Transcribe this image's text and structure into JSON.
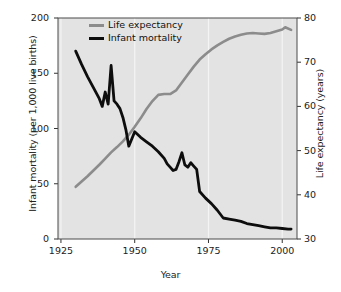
{
  "chart_data": {
    "type": "line",
    "title": "",
    "xlabel": "Year",
    "ylabel_left": "Infant mortality (per 1,000 live births)",
    "ylabel_right": "Life expectancy (years)",
    "xlim": [
      1924,
      2005
    ],
    "ylim_left": [
      0,
      200
    ],
    "ylim_right": [
      30,
      80
    ],
    "xticks": [
      1925,
      1950,
      1975,
      2000
    ],
    "xticklabels": [
      "1925",
      "1950",
      "1975",
      "2000"
    ],
    "yticks_left": [
      0,
      50,
      100,
      150,
      200
    ],
    "yticklabels_left": [
      "0",
      "50",
      "100",
      "150",
      "200"
    ],
    "yticks_right": [
      30,
      40,
      50,
      60,
      70,
      80
    ],
    "yticklabels_right": [
      "30",
      "40",
      "50",
      "60",
      "70",
      "80"
    ],
    "grid": "vertical-white-gridlines",
    "legend_position": "top-left-inside",
    "plot_background": "#e3e3e3",
    "series": [
      {
        "name": "Life expectancy",
        "axis": "right",
        "color": "#8c8c8c",
        "linewidth": 2.6,
        "x": [
          1930,
          1932,
          1934,
          1936,
          1938,
          1940,
          1942,
          1944,
          1946,
          1948,
          1950,
          1952,
          1954,
          1956,
          1958,
          1960,
          1962,
          1964,
          1966,
          1968,
          1970,
          1972,
          1974,
          1976,
          1978,
          1980,
          1982,
          1984,
          1986,
          1988,
          1990,
          1992,
          1994,
          1996,
          1998,
          2000,
          2001,
          2003
        ],
        "y": [
          41.8,
          43.0,
          44.2,
          45.5,
          46.8,
          48.2,
          49.6,
          50.8,
          52.1,
          53.6,
          55.4,
          57.3,
          59.4,
          61.2,
          62.6,
          62.8,
          62.8,
          63.6,
          65.4,
          67.2,
          69.0,
          70.6,
          71.8,
          72.9,
          73.8,
          74.6,
          75.3,
          75.8,
          76.2,
          76.5,
          76.6,
          76.5,
          76.4,
          76.6,
          77.0,
          77.4,
          77.9,
          77.3
        ]
      },
      {
        "name": "Infant mortality",
        "axis": "left",
        "color": "#0d0d0d",
        "linewidth": 2.8,
        "x": [
          1930,
          1932,
          1934,
          1936,
          1938,
          1939,
          1940,
          1941,
          1942,
          1943,
          1944,
          1945,
          1946,
          1947,
          1948,
          1950,
          1952,
          1954,
          1956,
          1958,
          1960,
          1961,
          1962,
          1963,
          1964,
          1965,
          1966,
          1967,
          1968,
          1969,
          1970,
          1971,
          1972,
          1974,
          1976,
          1978,
          1980,
          1982,
          1984,
          1986,
          1988,
          1990,
          1992,
          1994,
          1996,
          1998,
          2000,
          2002,
          2003
        ],
        "y": [
          170,
          158,
          147,
          137,
          127,
          120,
          133,
          122,
          157,
          125,
          122,
          118,
          110,
          99,
          84,
          97,
          92,
          88,
          84,
          79,
          73,
          68,
          65,
          62,
          63,
          70,
          78,
          67,
          65,
          69,
          66,
          63,
          43,
          37,
          32,
          26,
          19,
          18,
          17,
          16,
          14,
          13,
          12,
          11,
          10,
          10,
          9.5,
          9,
          9
        ]
      }
    ]
  },
  "legend": {
    "items": [
      {
        "label": "Life expectancy",
        "color": "#8c8c8c"
      },
      {
        "label": "Infant mortality",
        "color": "#0d0d0d"
      }
    ]
  },
  "axes": {
    "x_title": "Year",
    "y_left_title": "Infant mortality (per 1,000 live births)",
    "y_right_title": "Life expectancy (years)",
    "x_ticks": [
      "1925",
      "1950",
      "1975",
      "2000"
    ],
    "y_left_ticks": [
      "200",
      "150",
      "100",
      "50",
      "0"
    ],
    "y_right_ticks": [
      "80",
      "70",
      "60",
      "50",
      "40",
      "30"
    ]
  }
}
